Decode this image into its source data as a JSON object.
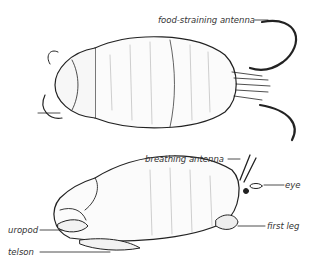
{
  "figure": {
    "top_view": {
      "labels": {
        "food_antenna": "food-straining antenna"
      }
    },
    "side_view": {
      "labels": {
        "breathing_antenna": "breathing antenna",
        "eye": "eye",
        "first_leg": "first leg",
        "uropod": "uropod",
        "telson": "telson"
      }
    }
  }
}
